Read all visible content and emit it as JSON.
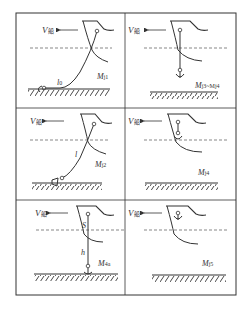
{
  "diagram": {
    "velocity_label": "V",
    "velocity_subscript": "船",
    "panels": [
      {
        "id": "p1",
        "moment_label": "M",
        "moment_sub": "j1",
        "length_label": "l",
        "length_sub": "0",
        "stage": "chain lying on seabed"
      },
      {
        "id": "p2",
        "moment_label": "M",
        "moment_sub": "j3~M",
        "moment_sub2": "j4",
        "stage": "anchor hanging below hull"
      },
      {
        "id": "p3",
        "moment_label": "M",
        "moment_sub": "j2",
        "length_label": "l",
        "stage": "chain lifting anchor off seabed"
      },
      {
        "id": "p4",
        "moment_label": "M",
        "moment_sub": "j4",
        "stage": "anchor near hawse"
      },
      {
        "id": "p5",
        "moment_label": "M",
        "moment_sub": "4a",
        "s_label": "S",
        "h_label": "h",
        "stage": "anchor breaking out vertically"
      },
      {
        "id": "p6",
        "moment_label": "M",
        "moment_sub": "j5",
        "stage": "anchor stowed"
      }
    ]
  }
}
